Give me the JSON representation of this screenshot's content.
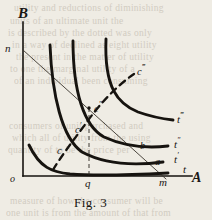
{
  "figure": {
    "caption": "Fig. 3",
    "axes": {
      "y_label": "B",
      "x_label": "A",
      "origin_label": "o"
    },
    "labels": {
      "n": "n",
      "m": "m",
      "q": "q",
      "a": "a",
      "b": "b",
      "c": "c",
      "c_prime": "c",
      "c_dprime": "c",
      "c_tprime": "c",
      "t": "t",
      "t_prime": "t",
      "t_dprime": "t",
      "t_tprime": "t",
      "prime_1": "′",
      "prime_2": "″",
      "prime_3": "‴"
    }
  },
  "chart_data": {
    "type": "line",
    "title": "Fig. 3",
    "xlabel": "A",
    "ylabel": "B",
    "grid": false,
    "legend": "inline-right",
    "xlim": [
      0,
      212
    ],
    "ylim": [
      0,
      220
    ],
    "annotations": [
      {
        "name": "origin",
        "text": "o",
        "x": 14,
        "y": 181
      },
      {
        "name": "y-axis-tip",
        "text": "B",
        "x": 22,
        "y": 14
      },
      {
        "name": "x-axis-tip",
        "text": "A",
        "x": 197,
        "y": 180
      },
      {
        "name": "budget-line-y-intercept",
        "text": "n",
        "x": 10,
        "y": 50
      },
      {
        "name": "budget-line-x-intercept",
        "text": "m",
        "x": 163,
        "y": 183
      },
      {
        "name": "quantity-q",
        "text": "q",
        "x": 89,
        "y": 186
      },
      {
        "name": "point-a",
        "text": "a",
        "x": 158,
        "y": 163
      },
      {
        "name": "point-b",
        "text": "b",
        "x": 144,
        "y": 148
      },
      {
        "name": "point-c",
        "text": "c",
        "x": 60,
        "y": 152
      },
      {
        "name": "point-c-prime",
        "text": "c′",
        "x": 79,
        "y": 128
      },
      {
        "name": "point-c-dprime",
        "text": "c″",
        "x": 95,
        "y": 108
      },
      {
        "name": "point-c-tprime",
        "text": "c‴",
        "x": 140,
        "y": 71
      },
      {
        "name": "curve-label-t",
        "text": "t",
        "x": 185,
        "y": 170
      },
      {
        "name": "curve-label-t-prime",
        "text": "t′",
        "x": 176,
        "y": 158
      },
      {
        "name": "curve-label-t-dprime",
        "text": "t″",
        "x": 176,
        "y": 144
      },
      {
        "name": "curve-label-t-tprime",
        "text": "t‴",
        "x": 180,
        "y": 119
      }
    ],
    "series": [
      {
        "name": "t",
        "kind": "indifference-curve",
        "style": "solid",
        "path": "M 29,145 C 40,168 52,172 70,174 C 95,176 130,175 168,173"
      },
      {
        "name": "t'",
        "kind": "indifference-curve",
        "style": "solid",
        "path": "M 50,45 C 52,95 62,138 82,152 C 108,166 140,165 163,162"
      },
      {
        "name": "t''",
        "kind": "indifference-curve",
        "style": "solid",
        "path": "M 73,41 C 73,92 84,126 104,137 C 128,148 150,148 168,146"
      },
      {
        "name": "t'''",
        "kind": "indifference-curve",
        "style": "solid",
        "path": "M 106,39 C 104,88 118,104 138,112 C 152,117 164,119 173,120"
      },
      {
        "name": "expansion-path",
        "kind": "expansion-path",
        "style": "dashed",
        "path": "M 53,170 C 60,158 72,142 84,126 C 98,106 115,87 134,74"
      },
      {
        "name": "budget-line",
        "kind": "budget-line",
        "style": "thin-solid",
        "path": "M 23,50 L 166,179"
      },
      {
        "name": "q-dropline",
        "kind": "guide",
        "style": "dashed-thin",
        "path": "M 89,108 L 89,176"
      }
    ],
    "axis_lines": [
      {
        "name": "y-axis",
        "path": "M 23,22 L 23,176"
      },
      {
        "name": "x-axis",
        "path": "M 23,176 L 192,176"
      }
    ]
  },
  "background_bleed": {
    "lines": [
      {
        "text": "utility and reductions of diminishing",
        "x": 14,
        "y": 3
      },
      {
        "text": "units of  an ultimate unit the",
        "x": 10,
        "y": 16
      },
      {
        "text": "is described by the dotted was only",
        "x": 8,
        "y": 28
      },
      {
        "text": "in a way of  declined as eight utility",
        "x": 12,
        "y": 40
      },
      {
        "text": "the present in the matter of utility",
        "x": 16,
        "y": 52
      },
      {
        "text": "to one the marginal utility of a",
        "x": 10,
        "y": 64
      },
      {
        "text": "of an individual been consuming",
        "x": 14,
        "y": 76
      },
      {
        "text": "consumers of unit purchased and",
        "x": 9,
        "y": 121
      },
      {
        "text": "which all of  utility from the using",
        "x": 12,
        "y": 133
      },
      {
        "text": "quantity of  to  be  the  price  per",
        "x": 8,
        "y": 145
      },
      {
        "text": "measure of how the consumer will be",
        "x": 10,
        "y": 196
      },
      {
        "text": "one unit is from the amount of that from",
        "x": 6,
        "y": 208
      }
    ]
  }
}
